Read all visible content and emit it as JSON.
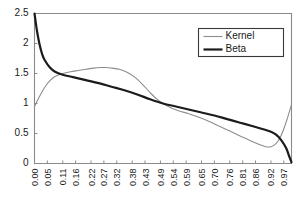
{
  "chart_data": {
    "type": "line",
    "title": "",
    "subtitle": "",
    "xlabel": "",
    "ylabel": "",
    "xlim": [
      0,
      1
    ],
    "ylim": [
      0,
      2.5
    ],
    "grid": false,
    "legend_position": "top-right",
    "y_ticks": [
      "0",
      "0.5",
      "1",
      "1.5",
      "2",
      "2.5"
    ],
    "y_tick_values": [
      0,
      0.5,
      1,
      1.5,
      2,
      2.5
    ],
    "categories": [
      "0.00",
      "0.05",
      "0.11",
      "0.16",
      "0.22",
      "0.27",
      "0.32",
      "0.38",
      "0.43",
      "0.49",
      "0.54",
      "0.59",
      "0.65",
      "0.70",
      "0.76",
      "0.81",
      "0.86",
      "0.92",
      "0.97"
    ],
    "x": [
      0.0,
      0.05,
      0.11,
      0.16,
      0.22,
      0.27,
      0.32,
      0.38,
      0.43,
      0.49,
      0.54,
      0.59,
      0.65,
      0.7,
      0.76,
      0.81,
      0.86,
      0.92,
      0.97
    ],
    "series": [
      {
        "name": "Kernel",
        "color": "#8d8d8d",
        "width": 1.1,
        "x": [
          0.0,
          0.02,
          0.04,
          0.06,
          0.08,
          0.11,
          0.14,
          0.17,
          0.2,
          0.23,
          0.26,
          0.28,
          0.3,
          0.33,
          0.36,
          0.39,
          0.42,
          0.45,
          0.48,
          0.52,
          0.56,
          0.6,
          0.64,
          0.68,
          0.72,
          0.76,
          0.8,
          0.84,
          0.88,
          0.9,
          0.92,
          0.94,
          0.96,
          0.98,
          1.0
        ],
        "values": [
          0.95,
          1.12,
          1.27,
          1.38,
          1.45,
          1.5,
          1.53,
          1.55,
          1.57,
          1.59,
          1.6,
          1.6,
          1.59,
          1.57,
          1.52,
          1.44,
          1.32,
          1.18,
          1.06,
          0.95,
          0.88,
          0.83,
          0.77,
          0.7,
          0.62,
          0.54,
          0.46,
          0.38,
          0.31,
          0.28,
          0.28,
          0.33,
          0.47,
          0.7,
          0.98
        ]
      },
      {
        "name": "Beta",
        "color": "#1b1b1b",
        "width": 2.2,
        "x": [
          0.0,
          0.01,
          0.02,
          0.03,
          0.04,
          0.06,
          0.08,
          0.11,
          0.15,
          0.2,
          0.25,
          0.3,
          0.35,
          0.4,
          0.45,
          0.5,
          0.55,
          0.6,
          0.65,
          0.7,
          0.75,
          0.8,
          0.85,
          0.89,
          0.92,
          0.94,
          0.96,
          0.98,
          0.99,
          1.0
        ],
        "values": [
          2.5,
          2.2,
          1.98,
          1.82,
          1.72,
          1.6,
          1.53,
          1.48,
          1.44,
          1.39,
          1.34,
          1.28,
          1.22,
          1.15,
          1.07,
          1.0,
          0.95,
          0.9,
          0.85,
          0.8,
          0.74,
          0.68,
          0.62,
          0.57,
          0.53,
          0.48,
          0.39,
          0.25,
          0.13,
          0.02
        ]
      }
    ],
    "legend": [
      {
        "label": "Kernel",
        "color": "#8d8d8d",
        "width": 1.1
      },
      {
        "label": "Beta",
        "color": "#1b1b1b",
        "width": 2.2
      }
    ]
  }
}
